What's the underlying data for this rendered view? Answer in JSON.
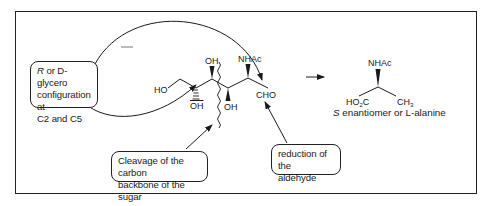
{
  "diagram": {
    "callouts": {
      "config_line1_italic": "R",
      "config_line1_rest": " or D-glycero",
      "config_line2": "configuration at",
      "config_line3": "C2 and C5",
      "cleavage_line1": "Cleavage of the carbon",
      "cleavage_line2": "backbone of the sugar",
      "reduction_line1": "reduction of the",
      "reduction_line2": "aldehyde"
    },
    "sugar_labels": {
      "ho_left": "HO",
      "oh_top": "OH",
      "oh_bottom_left": "OH",
      "oh_bottom_right": "OH",
      "nhac": "NHAc",
      "cho": "CHO"
    },
    "product_labels": {
      "nhac": "NHAc",
      "ho2c_main": "HO",
      "ho2c_sub": "2",
      "ho2c_end": "C",
      "ch3_main": "CH",
      "ch3_sub": "3"
    },
    "caption": {
      "italic": "S",
      "rest": " enantiomer or  L-alanine"
    },
    "colors": {
      "ink": "#1a1a1a",
      "background": "#ffffff"
    }
  }
}
